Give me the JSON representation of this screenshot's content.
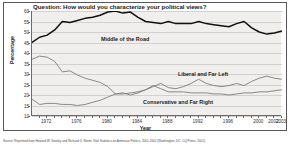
{
  "chart_data": {
    "type": "line",
    "title": "Question: How would you characterize your political views?",
    "xlabel": "Year",
    "ylabel": "Percentage",
    "ylim": [
      10,
      60
    ],
    "xlim": [
      1970,
      2003
    ],
    "grid": true,
    "legend_position": "inline-annotations",
    "yticks": [
      60,
      55,
      50,
      45,
      40,
      35,
      30,
      25,
      20,
      15,
      10
    ],
    "xticks": [
      1972,
      1976,
      1980,
      1984,
      1988,
      1992,
      1996,
      2000,
      2002,
      2003
    ],
    "x": [
      1970,
      1971,
      1972,
      1973,
      1974,
      1975,
      1976,
      1977,
      1978,
      1979,
      1980,
      1981,
      1982,
      1983,
      1984,
      1985,
      1986,
      1987,
      1988,
      1989,
      1990,
      1991,
      1992,
      1993,
      1994,
      1995,
      1996,
      1997,
      1998,
      1999,
      2000,
      2001,
      2002,
      2003
    ],
    "series": [
      {
        "name": "Middle of the Road",
        "color": "#111111",
        "values": [
          45.0,
          47.5,
          48.5,
          51.0,
          55.0,
          54.5,
          55.5,
          56.5,
          57.0,
          58.0,
          59.5,
          60.0,
          59.0,
          59.5,
          57.0,
          55.0,
          54.5,
          54.0,
          55.0,
          54.0,
          54.0,
          54.0,
          55.0,
          54.0,
          53.5,
          53.0,
          52.5,
          54.0,
          55.0,
          52.0,
          50.0,
          49.0,
          49.5,
          50.5
        ]
      },
      {
        "name": "Liberal and Far Left",
        "color": "#7d7d7f",
        "values": [
          37.0,
          38.5,
          38.0,
          36.0,
          31.0,
          31.5,
          29.5,
          28.0,
          27.0,
          26.0,
          24.0,
          20.5,
          21.0,
          20.0,
          21.0,
          22.5,
          24.0,
          25.5,
          23.5,
          23.0,
          24.0,
          25.5,
          27.5,
          25.5,
          24.5,
          24.0,
          24.5,
          25.5,
          24.5,
          26.5,
          28.0,
          29.0,
          28.0,
          27.5
        ]
      },
      {
        "name": "Conservative and Far Right",
        "color": "#7d7d7f",
        "values": [
          18.0,
          15.5,
          16.0,
          16.0,
          15.5,
          15.5,
          15.0,
          15.5,
          16.5,
          17.5,
          19.0,
          20.5,
          20.5,
          21.0,
          21.5,
          22.5,
          24.5,
          23.0,
          21.5,
          21.5,
          21.5,
          21.0,
          21.0,
          21.0,
          20.5,
          20.5,
          20.0,
          20.5,
          21.0,
          21.0,
          21.5,
          21.5,
          22.0,
          22.5
        ]
      }
    ],
    "source": "Source: Reprinted from Howard W. Stanley and Richard G. Niemi, Vital Statistics on American Politics, 2001-2002 (Washington, DC: CQ Press, 2001)."
  }
}
